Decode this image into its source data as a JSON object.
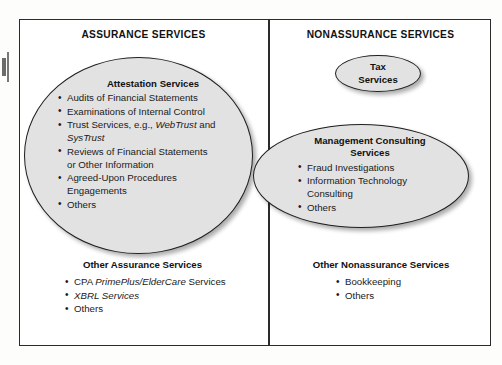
{
  "diagram": {
    "columns": {
      "left_title": "ASSURANCE SERVICES",
      "right_title": "NONASSURANCE SERVICES"
    },
    "attestation": {
      "heading": "Attestation Services",
      "items": [
        {
          "pre": "Audits of Financial Statements",
          "em": "",
          "post": ""
        },
        {
          "pre": "Examinations of Internal Control",
          "em": "",
          "post": ""
        },
        {
          "pre": "Trust Services, e.g., ",
          "em": "WebTrust",
          "post": " and"
        },
        {
          "pre": "",
          "em": "SysTrust",
          "post": "",
          "continuation": true
        },
        {
          "pre": "Reviews of Financial Statements",
          "em": "",
          "post": ""
        },
        {
          "pre": "or Other Information",
          "em": "",
          "post": "",
          "continuation": true
        },
        {
          "pre": "Agreed-Upon Procedures",
          "em": "",
          "post": ""
        },
        {
          "pre": "Engagements",
          "em": "",
          "post": "",
          "continuation": true
        },
        {
          "pre": "Others",
          "em": "",
          "post": ""
        }
      ]
    },
    "tax": {
      "line1": "Tax",
      "line2": "Services"
    },
    "management_consulting": {
      "heading_line1": "Management Consulting",
      "heading_line2": "Services",
      "items": [
        {
          "pre": "Fraud Investigations",
          "em": "",
          "post": ""
        },
        {
          "pre": "Information Technology",
          "em": "",
          "post": ""
        },
        {
          "pre": "Consulting",
          "em": "",
          "post": "",
          "continuation": true
        },
        {
          "pre": "Others",
          "em": "",
          "post": ""
        }
      ]
    },
    "other_assurance": {
      "heading": "Other Assurance Services",
      "items": [
        {
          "pre": "CPA ",
          "em": "PrimePlus/ElderCare",
          "post": " Services"
        },
        {
          "pre": "",
          "em": "XBRL Services",
          "post": ""
        },
        {
          "pre": "Others",
          "em": "",
          "post": ""
        }
      ]
    },
    "other_nonassurance": {
      "heading": "Other Nonassurance Services",
      "items": [
        {
          "pre": "Bookkeeping",
          "em": "",
          "post": ""
        },
        {
          "pre": "Others",
          "em": "",
          "post": ""
        }
      ]
    },
    "colors": {
      "oval_fill": "#e2e2e2",
      "oval_stroke": "#1f1f1f",
      "frame_stroke": "#2b2b2b",
      "text": "#1a1a1a",
      "page": "#ffffff"
    }
  }
}
